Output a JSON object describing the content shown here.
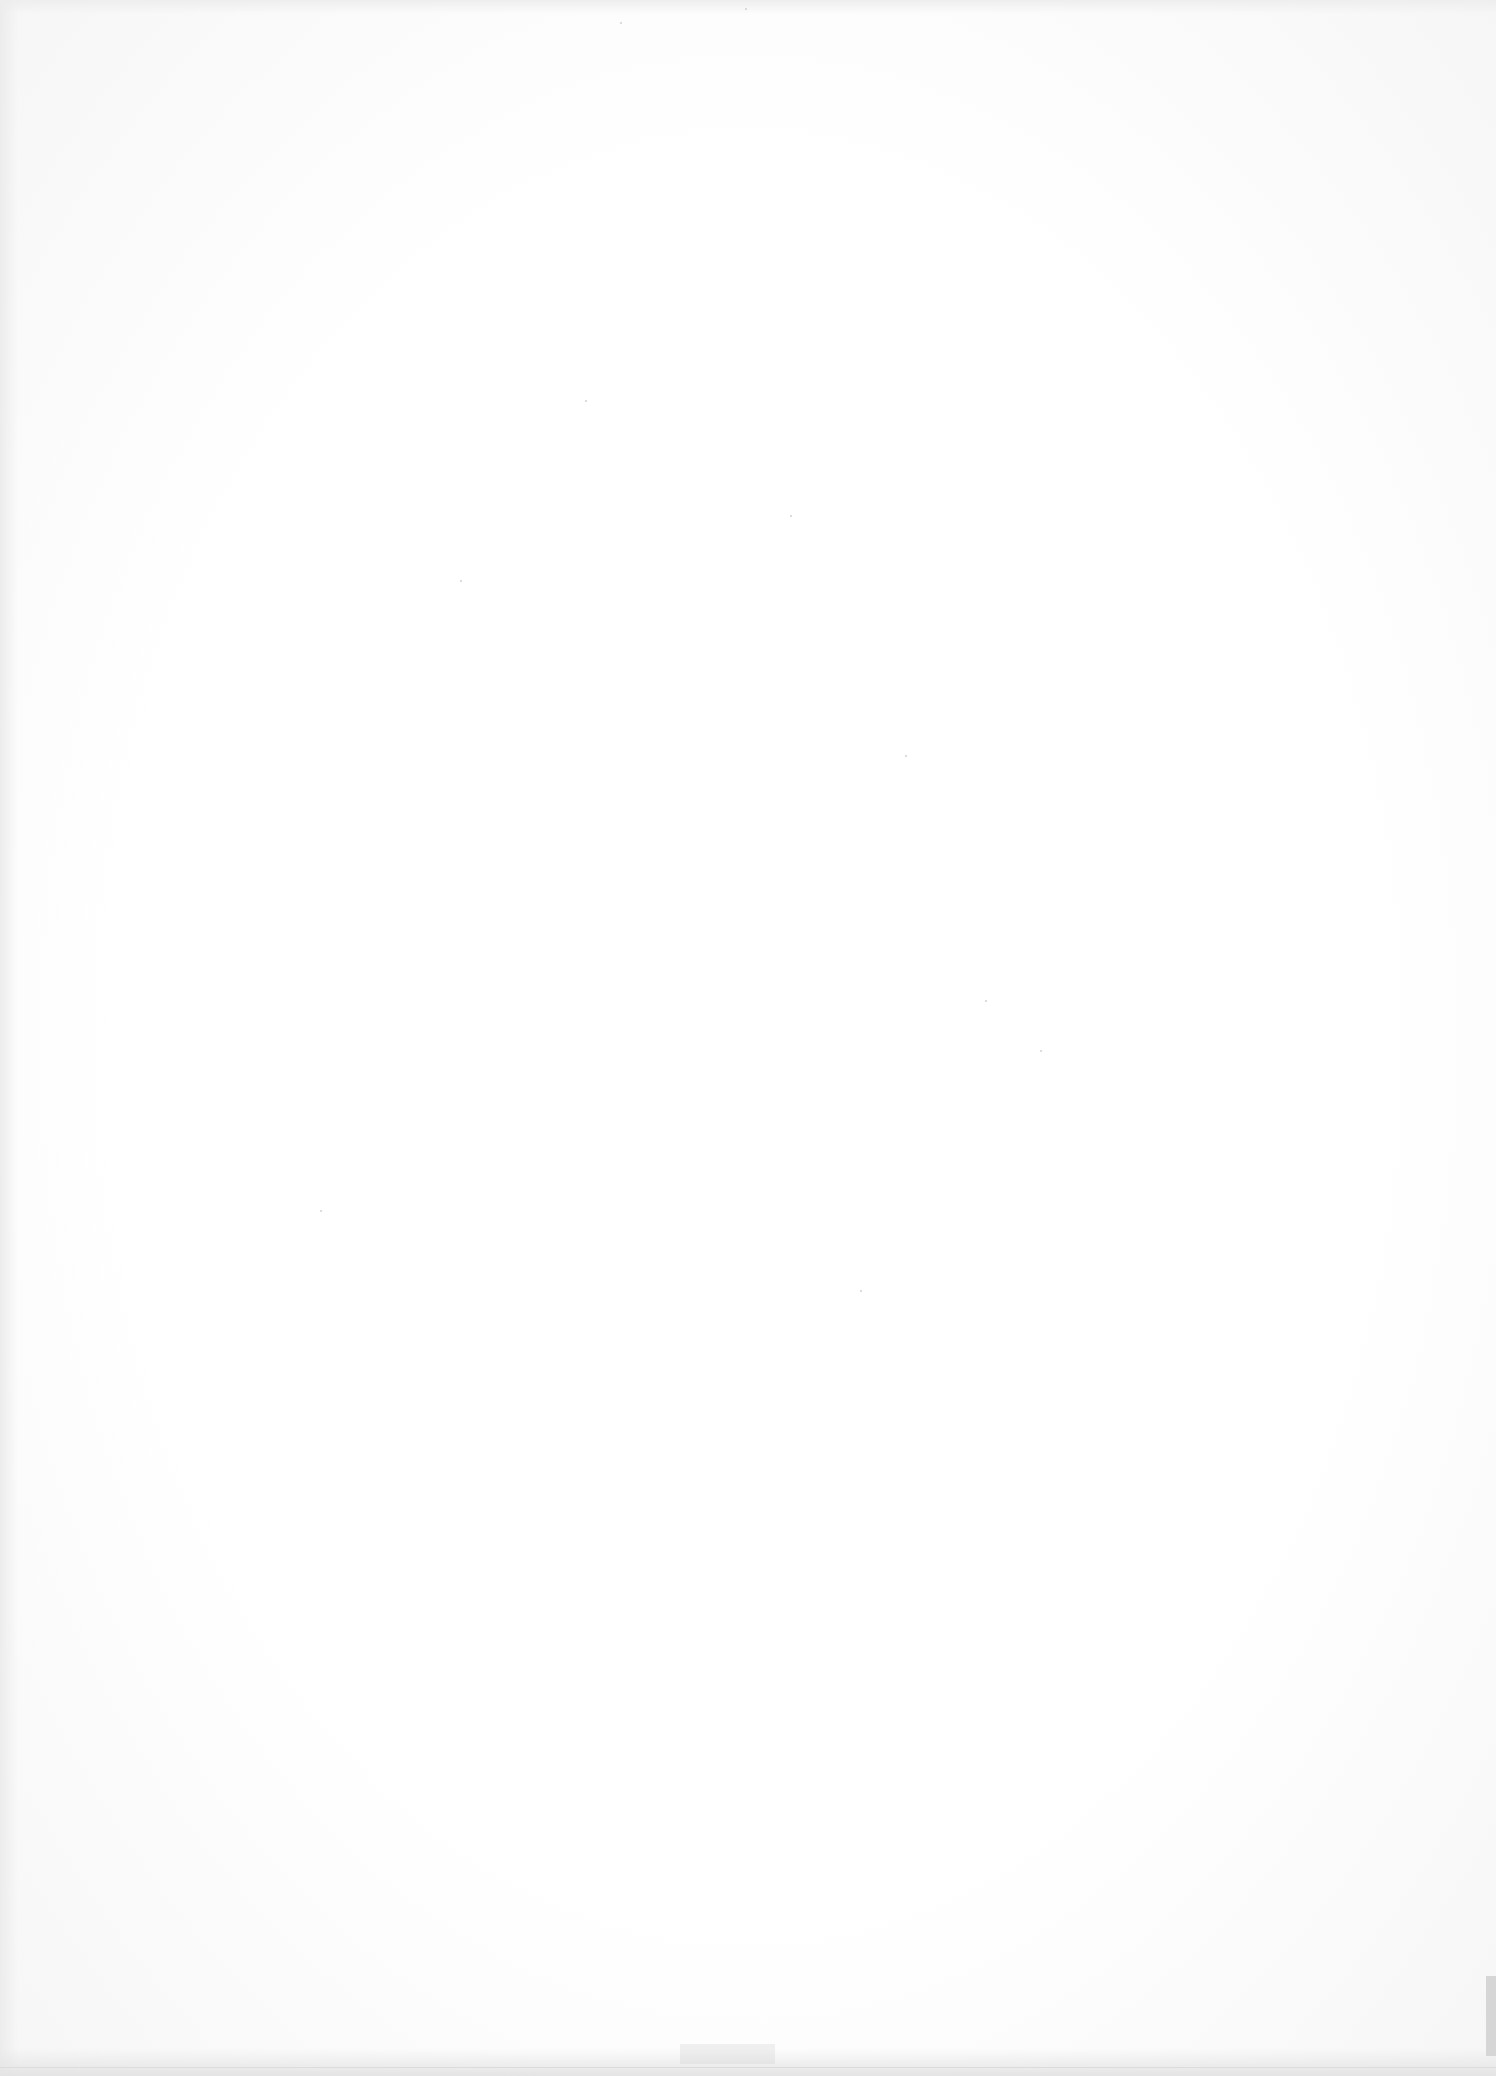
{
  "document": {
    "type": "blank scanned page",
    "text": "",
    "colors": {
      "paper": "#fdfdfd",
      "edge_shadow": "#e4e4e4"
    }
  }
}
